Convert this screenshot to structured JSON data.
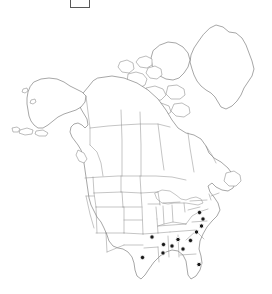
{
  "figure": {
    "type": "distribution-map",
    "region": "North America",
    "background_color": "#ffffff",
    "outline_color": "#6b6b6b",
    "border_color": "#8a8a8a",
    "dot_color": "#1a1a1a",
    "dot_halo_color": "#ffffff"
  },
  "legend": {
    "label": "",
    "box_border_color": "#585858",
    "box_fill_color": "#ffffff"
  },
  "map_data": {
    "type": "point-distribution",
    "projection_extent": {
      "width": 272,
      "height": 294
    },
    "dot_radius": 2.2,
    "dot_count": 13,
    "occurrences": [
      {
        "label": "southeast-point-1",
        "x": 152.0,
        "y": 237.0
      },
      {
        "label": "southeast-point-2",
        "x": 142.5,
        "y": 257.5
      },
      {
        "label": "southeast-point-3",
        "x": 163.5,
        "y": 244.5
      },
      {
        "label": "southeast-point-4",
        "x": 172.0,
        "y": 246.0
      },
      {
        "label": "southeast-point-5",
        "x": 163.0,
        "y": 253.0
      },
      {
        "label": "southeast-point-6",
        "x": 178.0,
        "y": 239.5
      },
      {
        "label": "southeast-point-7",
        "x": 183.0,
        "y": 249.0
      },
      {
        "label": "southeast-point-8",
        "x": 190.5,
        "y": 240.5
      },
      {
        "label": "southeast-point-9",
        "x": 196.5,
        "y": 232.0
      },
      {
        "label": "southeast-point-10",
        "x": 201.5,
        "y": 226.0
      },
      {
        "label": "southeast-point-11",
        "x": 203.0,
        "y": 219.0
      },
      {
        "label": "southeast-point-12",
        "x": 199.5,
        "y": 212.5
      },
      {
        "label": "florida-point-1",
        "x": 199.0,
        "y": 264.5
      }
    ]
  }
}
